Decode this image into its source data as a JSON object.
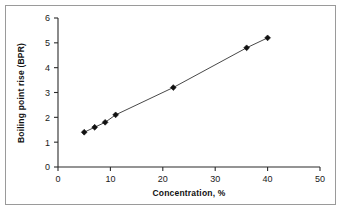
{
  "chart_data": {
    "type": "scatter",
    "title": "",
    "xlabel": "Concentration, %",
    "ylabel": "Boiling point rise (BPR)",
    "xlim": [
      0,
      50
    ],
    "ylim": [
      0,
      6
    ],
    "xticks": [
      "0",
      "10",
      "20",
      "30",
      "40",
      "50"
    ],
    "xtick_values": [
      0,
      10,
      20,
      30,
      40,
      50
    ],
    "yticks": [
      "0",
      "1",
      "2",
      "3",
      "4",
      "5",
      "6"
    ],
    "ytick_values": [
      0,
      1,
      2,
      3,
      4,
      5,
      6
    ],
    "grid": false,
    "legend": "none",
    "marker": "diamond",
    "marker_color": "#111111",
    "line_color": "#333333",
    "x": [
      5,
      7,
      9,
      11,
      22,
      36,
      40
    ],
    "y": [
      1.4,
      1.6,
      1.8,
      2.1,
      3.2,
      4.8,
      5.2
    ],
    "series": [
      {
        "name": "Boiling point rise",
        "points": [
          {
            "x": 5,
            "y": 1.4
          },
          {
            "x": 7,
            "y": 1.6
          },
          {
            "x": 9,
            "y": 1.8
          },
          {
            "x": 11,
            "y": 2.1
          },
          {
            "x": 22,
            "y": 3.2
          },
          {
            "x": 36,
            "y": 4.8
          },
          {
            "x": 40,
            "y": 5.2
          }
        ]
      }
    ]
  },
  "figure": {
    "border_color": "#9a9a9a",
    "background": "#ffffff"
  }
}
